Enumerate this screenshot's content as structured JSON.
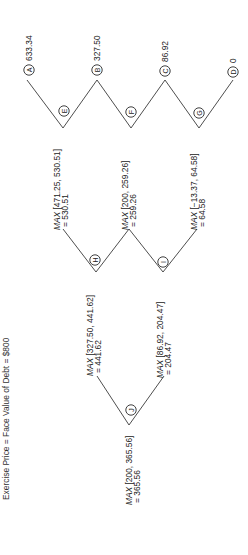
{
  "caption": "Exercise Price = Face Value of Debt = $800",
  "orientation": "rotated 90deg counter-clockwise",
  "terminal_nodes": [
    {
      "id": "A",
      "value": "633.34"
    },
    {
      "id": "B",
      "value": "327.50"
    },
    {
      "id": "C",
      "value": "86.92"
    },
    {
      "id": "D",
      "value": "0"
    }
  ],
  "intermediate_nodes": [
    {
      "id": "E",
      "max_prefix": "MAX",
      "max_args": " [471.25, 530.51]",
      "result": "= 530.51"
    },
    {
      "id": "F",
      "max_prefix": "MAX",
      "max_args": " [200, 259.26]",
      "result": "= 259.26"
    },
    {
      "id": "G",
      "max_prefix": "MAX",
      "max_args": " [−13.37, 64.58]",
      "result": "= 64.58"
    },
    {
      "id": "H",
      "max_prefix": "MAX",
      "max_args": " [327.50, 441.62]",
      "result": "= 441.62"
    },
    {
      "id": "I",
      "max_prefix": "MAX",
      "max_args": " [86.92, 204.47]",
      "result": "= 204.47"
    },
    {
      "id": "J",
      "max_prefix": "MAX",
      "max_args": " [200, 365.56]",
      "result": "= 365.56"
    }
  ]
}
